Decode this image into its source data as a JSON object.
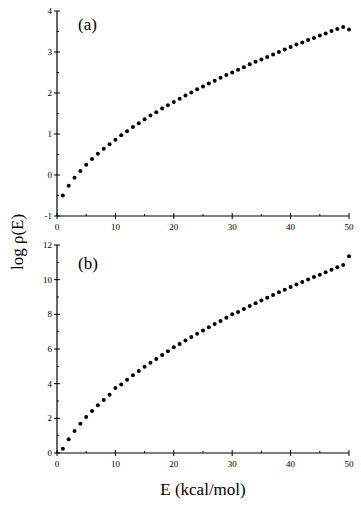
{
  "chart_data": [
    {
      "type": "scatter",
      "panel_label": "(a)",
      "xlabel": "E (kcal/mol)",
      "ylabel": "log ρ(E)",
      "xlim": [
        0,
        50
      ],
      "ylim": [
        -1,
        4
      ],
      "xticks": [
        0,
        10,
        20,
        30,
        40,
        50
      ],
      "yticks": [
        -1,
        0,
        1,
        2,
        3,
        4
      ],
      "grid": false,
      "series": [
        {
          "name": "(a)",
          "x": [
            1,
            2,
            3,
            4,
            5,
            6,
            7,
            8,
            9,
            10,
            11,
            12,
            13,
            14,
            15,
            16,
            17,
            18,
            19,
            20,
            21,
            22,
            23,
            24,
            25,
            26,
            27,
            28,
            29,
            30,
            31,
            32,
            33,
            34,
            35,
            36,
            37,
            38,
            39,
            40,
            41,
            42,
            43,
            44,
            45,
            46,
            47,
            48,
            49,
            50
          ],
          "y": [
            -0.5,
            -0.26,
            -0.07,
            0.1,
            0.25,
            0.39,
            0.52,
            0.64,
            0.75,
            0.86,
            0.97,
            1.07,
            1.17,
            1.26,
            1.36,
            1.45,
            1.53,
            1.62,
            1.7,
            1.78,
            1.86,
            1.94,
            2.01,
            2.09,
            2.16,
            2.23,
            2.3,
            2.37,
            2.44,
            2.5,
            2.57,
            2.63,
            2.7,
            2.76,
            2.82,
            2.88,
            2.94,
            3.0,
            3.06,
            3.12,
            3.18,
            3.23,
            3.29,
            3.34,
            3.4,
            3.45,
            3.51,
            3.56,
            3.61,
            3.55
          ]
        }
      ]
    },
    {
      "type": "scatter",
      "panel_label": "(b)",
      "xlabel": "E (kcal/mol)",
      "ylabel": "log ρ(E)",
      "xlim": [
        0,
        50
      ],
      "ylim": [
        0,
        12
      ],
      "xticks": [
        0,
        10,
        20,
        30,
        40,
        50
      ],
      "yticks": [
        0,
        2,
        4,
        6,
        8,
        10,
        12
      ],
      "grid": false,
      "series": [
        {
          "name": "(b)",
          "x": [
            1,
            2,
            3,
            4,
            5,
            6,
            7,
            8,
            9,
            10,
            11,
            12,
            13,
            14,
            15,
            16,
            17,
            18,
            19,
            20,
            21,
            22,
            23,
            24,
            25,
            26,
            27,
            28,
            29,
            30,
            31,
            32,
            33,
            34,
            35,
            36,
            37,
            38,
            39,
            40,
            41,
            42,
            43,
            44,
            45,
            46,
            47,
            48,
            49,
            50
          ],
          "y": [
            0.25,
            0.8,
            1.27,
            1.69,
            2.07,
            2.42,
            2.75,
            3.06,
            3.36,
            3.75,
            3.95,
            4.22,
            4.48,
            4.73,
            4.97,
            5.2,
            5.43,
            5.65,
            5.87,
            6.1,
            6.29,
            6.49,
            6.69,
            6.88,
            7.07,
            7.26,
            7.44,
            7.62,
            7.8,
            8.0,
            8.14,
            8.31,
            8.48,
            8.64,
            8.8,
            8.96,
            9.11,
            9.27,
            9.42,
            9.57,
            9.72,
            9.86,
            10.01,
            10.15,
            10.29,
            10.43,
            10.57,
            10.71,
            10.84,
            11.35
          ]
        }
      ]
    }
  ],
  "labels": {
    "panel_a": "(a)",
    "panel_b": "(b)",
    "xlabel": "E (kcal/mol)",
    "ylabel": "log ρ(E)"
  }
}
